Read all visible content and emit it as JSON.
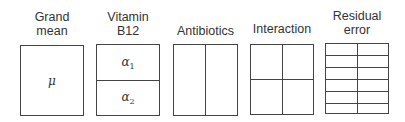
{
  "diagram": {
    "title": "",
    "panels": [
      {
        "label_line1": "Grand",
        "label_line2": "mean",
        "cells": "1x1",
        "symbol": "μ"
      },
      {
        "label_line1": "Vitamin",
        "label_line2": "B12",
        "cells": "2 rows x 1 col",
        "symbols": [
          {
            "base": "α",
            "sub": "1"
          },
          {
            "base": "α",
            "sub": "2"
          }
        ]
      },
      {
        "label_line1": "",
        "label_line2": "Antibiotics",
        "cells": "1 row x 2 cols"
      },
      {
        "label_line1": "",
        "label_line2": "Interaction",
        "cells": "2 rows x 2 cols"
      },
      {
        "label_line1": "Residual",
        "label_line2": "error",
        "cells": "6 rows x 2 cols"
      }
    ]
  }
}
